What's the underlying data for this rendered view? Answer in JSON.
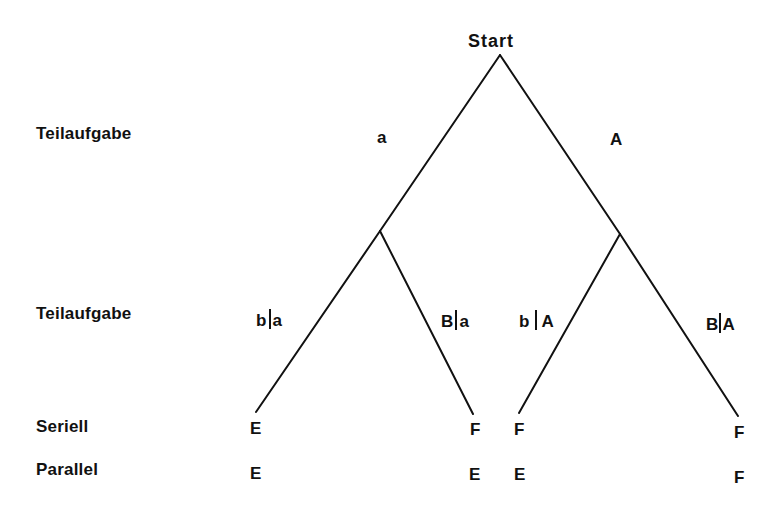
{
  "diagram": {
    "type": "probability-tree",
    "root": {
      "label": "Start"
    },
    "row_labels": [
      {
        "id": "level1",
        "text": "Teilaufgabe"
      },
      {
        "id": "level2",
        "text": "Teilaufgabe"
      },
      {
        "id": "seriell",
        "text": "Seriell"
      },
      {
        "id": "parallel",
        "text": "Parallel"
      }
    ],
    "level1_branches": [
      {
        "id": "left",
        "label": "a"
      },
      {
        "id": "right",
        "label": "A"
      }
    ],
    "level2_branches": [
      {
        "id": "ll",
        "given": "a",
        "outcome": "b"
      },
      {
        "id": "lr",
        "given": "a",
        "outcome": "B"
      },
      {
        "id": "rl",
        "given": "A",
        "outcome": "b"
      },
      {
        "id": "rr",
        "given": "A",
        "outcome": "B"
      }
    ],
    "leaves": [
      {
        "id": "leaf1",
        "seriell": "E",
        "parallel": "E"
      },
      {
        "id": "leaf2",
        "seriell": "F",
        "parallel": "E"
      },
      {
        "id": "leaf3",
        "seriell": "F",
        "parallel": "E"
      },
      {
        "id": "leaf4",
        "seriell": "F",
        "parallel": "F"
      }
    ],
    "line_color": "#111111"
  }
}
